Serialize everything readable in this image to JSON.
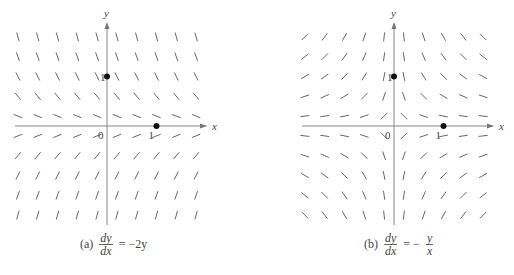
{
  "figure": {
    "panels": [
      {
        "id": "a",
        "caption_label": "(a)",
        "equation": {
          "num": "dy",
          "den": "dx",
          "rhs": "= −2y",
          "rhs_frac": null,
          "rhs_prefix": ""
        },
        "axis_labels": {
          "x": "x",
          "y": "y",
          "origin": "0",
          "x_tick": "1",
          "y_tick": "1"
        },
        "points": [
          [
            0,
            1
          ],
          [
            1,
            0
          ]
        ]
      },
      {
        "id": "b",
        "caption_label": "(b)",
        "equation": {
          "num": "dy",
          "den": "dx",
          "rhs": "",
          "rhs_prefix": "= −",
          "rhs_frac": {
            "num": "y",
            "den": "x"
          }
        },
        "axis_labels": {
          "x": "x",
          "y": "y",
          "origin": "0",
          "x_tick": "1",
          "y_tick": "1"
        },
        "points": [
          [
            0,
            1
          ],
          [
            1,
            0
          ]
        ]
      }
    ]
  },
  "chart_data": [
    {
      "type": "direction_field",
      "title": "(a) dy/dx = -2y",
      "xlabel": "x",
      "ylabel": "y",
      "grid_x": [
        -1.8,
        -1.4,
        -1.0,
        -0.6,
        -0.2,
        0.2,
        0.6,
        1.0,
        1.4,
        1.8
      ],
      "grid_y": [
        1.8,
        1.4,
        1.0,
        0.6,
        0.2,
        -0.2,
        -0.6,
        -1.0,
        -1.4,
        -1.8
      ],
      "slope_function": "-2*y",
      "marked_points": [
        [
          0,
          1
        ],
        [
          1,
          0
        ]
      ],
      "tick_labels": {
        "x": [
          "0",
          "1"
        ],
        "y": [
          "1"
        ]
      }
    },
    {
      "type": "direction_field",
      "title": "(b) dy/dx = -y/x",
      "xlabel": "x",
      "ylabel": "y",
      "grid_x": [
        -1.8,
        -1.4,
        -1.0,
        -0.6,
        -0.2,
        0.2,
        0.6,
        1.0,
        1.4,
        1.8
      ],
      "grid_y": [
        1.8,
        1.4,
        1.0,
        0.6,
        0.2,
        -0.2,
        -0.6,
        -1.0,
        -1.4,
        -1.8
      ],
      "slope_function": "-y/x",
      "marked_points": [
        [
          0,
          1
        ],
        [
          1,
          0
        ]
      ],
      "tick_labels": {
        "x": [
          "0",
          "1"
        ],
        "y": [
          "1"
        ]
      }
    }
  ],
  "colors": {
    "segment": "#555555",
    "axis": "#777777",
    "point": "#111111",
    "text": "#444444"
  }
}
